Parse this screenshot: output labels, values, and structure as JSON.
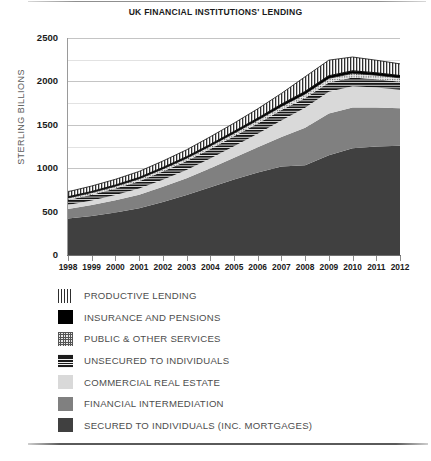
{
  "chart_data": {
    "type": "area",
    "stacked": true,
    "title": "UK FINANCIAL INSTITUTIONS' LENDING",
    "xlabel": "",
    "ylabel": "STERLING BILLIONS",
    "xlim": [
      1998,
      2012
    ],
    "ylim": [
      0,
      2500
    ],
    "ytick_step": 500,
    "grid": true,
    "grid_minor": true,
    "legend_position": "below",
    "categories": [
      "1998",
      "1999",
      "2000",
      "2001",
      "2002",
      "2003",
      "2004",
      "2005",
      "2006",
      "2007",
      "2008",
      "2009",
      "2010",
      "2011",
      "2012"
    ],
    "yticks": [
      "0",
      "500",
      "1000",
      "1500",
      "2000",
      "2500"
    ],
    "series": [
      {
        "name": "SECURED TO INDIVIDUALS (INC. MORTGAGES)",
        "key": "secured",
        "color": "#404040",
        "pattern": "solid",
        "values": [
          420,
          450,
          490,
          540,
          610,
          690,
          780,
          870,
          950,
          1020,
          1035,
          1150,
          1230,
          1250,
          1260
        ]
      },
      {
        "name": "FINANCIAL INTERMEDIATION",
        "key": "financial",
        "color": "#808080",
        "pattern": "solid",
        "values": [
          110,
          125,
          140,
          155,
          175,
          195,
          220,
          250,
          290,
          340,
          430,
          480,
          470,
          450,
          430
        ]
      },
      {
        "name": "COMMERCIAL REAL ESTATE",
        "key": "commercial",
        "color": "#d9d9d9",
        "pattern": "solid",
        "values": [
          45,
          52,
          60,
          70,
          82,
          95,
          112,
          132,
          158,
          190,
          230,
          250,
          245,
          230,
          215
        ]
      },
      {
        "name": "UNSECURED TO INDIVIDUALS",
        "key": "unsecured",
        "color": "#1c1c1c",
        "pattern": "horizontal-lines",
        "values": [
          60,
          68,
          76,
          85,
          95,
          103,
          110,
          115,
          118,
          120,
          115,
          108,
          100,
          95,
          90
        ]
      },
      {
        "name": "PUBLIC & OTHER SERVICES",
        "key": "public",
        "color": "#e9e9e9",
        "pattern": "dots",
        "values": [
          22,
          24,
          26,
          28,
          30,
          32,
          34,
          36,
          38,
          42,
          46,
          48,
          48,
          47,
          46
        ]
      },
      {
        "name": "INSURANCE AND PENSIONS",
        "key": "insurance",
        "color": "#000000",
        "pattern": "solid",
        "values": [
          12,
          13,
          14,
          15,
          16,
          17,
          18,
          20,
          22,
          25,
          28,
          29,
          28,
          27,
          26
        ]
      },
      {
        "name": "PRODUCTIVE LENDING",
        "key": "productive",
        "color": "#ffffff",
        "pattern": "vertical-lines",
        "values": [
          60,
          63,
          66,
          70,
          75,
          80,
          88,
          96,
          108,
          125,
          170,
          180,
          160,
          145,
          135
        ]
      }
    ],
    "totals": [
      729,
      795,
      872,
      963,
      1083,
      1212,
      1362,
      1519,
      1684,
      1862,
      2054,
      2245,
      2281,
      2244,
      2202
    ]
  },
  "legend": {
    "items": [
      {
        "label": "PRODUCTIVE LENDING",
        "swatch": "sw-productive",
        "icon": "vertical-lines-swatch"
      },
      {
        "label": "INSURANCE AND PENSIONS",
        "swatch": "sw-insurance",
        "icon": "solid-black-swatch"
      },
      {
        "label": "PUBLIC & OTHER SERVICES",
        "swatch": "sw-public",
        "icon": "dotted-swatch"
      },
      {
        "label": "UNSECURED TO INDIVIDUALS",
        "swatch": "sw-unsecured",
        "icon": "horizontal-lines-swatch"
      },
      {
        "label": "COMMERCIAL REAL ESTATE",
        "swatch": "sw-commercial",
        "icon": "light-gray-swatch"
      },
      {
        "label": "FINANCIAL INTERMEDIATION",
        "swatch": "sw-financial",
        "icon": "mid-gray-swatch"
      },
      {
        "label": "SECURED TO INDIVIDUALS (INC. MORTGAGES)",
        "swatch": "sw-secured",
        "icon": "dark-gray-swatch"
      }
    ]
  },
  "colors": {
    "secured": "#404040",
    "financial": "#808080",
    "commercial": "#d9d9d9",
    "unsecured": "#1c1c1c",
    "public": "#e9e9e9",
    "insurance": "#000000",
    "productive": "#ffffff",
    "grid": "#c9c9c9",
    "axis": "#6f6f6f",
    "text": "#1a1a1a",
    "legend_text": "#4d4d4d"
  }
}
